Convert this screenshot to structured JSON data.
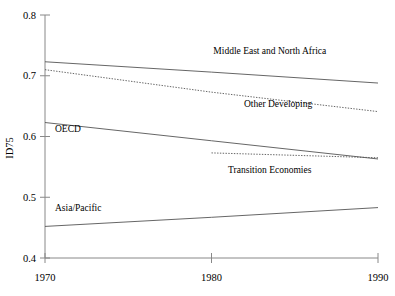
{
  "chart_data": {
    "type": "line",
    "title": "",
    "xlabel": "",
    "ylabel": "ID75",
    "x": [
      1970,
      1980,
      1990
    ],
    "xlim": [
      1970,
      1990
    ],
    "ylim": [
      0.4,
      0.8
    ],
    "xticks": [
      "1970",
      "1980",
      "1990"
    ],
    "yticks": [
      "0.4",
      "0.5",
      "0.6",
      "0.7",
      "0.8"
    ],
    "grid": false,
    "legend_position": "inline-annotations",
    "series": [
      {
        "name": "Middle East and North Africa",
        "style": "solid",
        "x": [
          1970,
          1980,
          1990
        ],
        "values": [
          0.723,
          0.706,
          0.688
        ]
      },
      {
        "name": "Other Developing",
        "style": "dotted",
        "x": [
          1970,
          1980,
          1990
        ],
        "values": [
          0.71,
          0.673,
          0.641
        ]
      },
      {
        "name": "OECD",
        "style": "solid",
        "x": [
          1970,
          1980,
          1990
        ],
        "values": [
          0.623,
          0.593,
          0.563
        ]
      },
      {
        "name": "Transition Economies",
        "style": "dotted",
        "x": [
          1980,
          1990
        ],
        "values": [
          0.573,
          0.565
        ]
      },
      {
        "name": "Asia/Pacific",
        "style": "solid",
        "x": [
          1970,
          1980,
          1990
        ],
        "values": [
          0.452,
          0.467,
          0.483
        ]
      }
    ],
    "annotations": [
      {
        "text": "Middle East and North Africa",
        "x": 1983.5,
        "y": 0.735
      },
      {
        "text": "Other Developing",
        "x": 1984.0,
        "y": 0.648
      },
      {
        "text": "Transition Economies",
        "x": 1983.5,
        "y": 0.54
      },
      {
        "text": "OECD",
        "x": 1970.6,
        "y": 0.607
      },
      {
        "text": "Asia/Pacific",
        "x": 1970.6,
        "y": 0.478
      }
    ],
    "colors": {
      "axis": "#777777",
      "line": "#555555",
      "text": "#000000",
      "background": "#ffffff"
    }
  }
}
